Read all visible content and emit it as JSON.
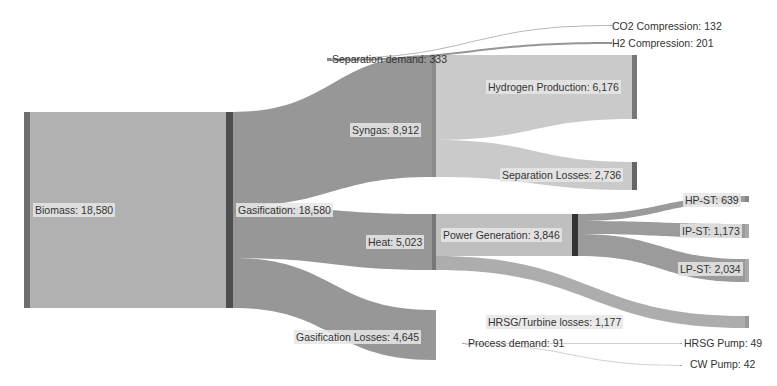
{
  "chart_data": {
    "type": "sankey",
    "title": "",
    "nodes": [
      {
        "id": "biomass",
        "label": "Biomass: 18,580",
        "name": "Biomass",
        "value": 18580,
        "x": 24,
        "y": 112,
        "w": 6,
        "h": 196,
        "color": "#6e6e6e"
      },
      {
        "id": "gasification",
        "label": "Gasification: 18,580",
        "name": "Gasification",
        "value": 18580,
        "x": 226,
        "y": 112,
        "w": 7,
        "h": 196,
        "color": "#4f4f4f"
      },
      {
        "id": "syngas",
        "label": "Syngas: 8,912",
        "name": "Syngas",
        "value": 8912,
        "x": 432,
        "y": 55,
        "w": 4,
        "h": 122,
        "color": "#8a8a8a"
      },
      {
        "id": "heat",
        "label": "Heat: 5,023",
        "name": "Heat",
        "value": 5023,
        "x": 432,
        "y": 214,
        "w": 4,
        "h": 56,
        "color": "#777777"
      },
      {
        "id": "gas_losses",
        "label": "Gasification Losses: 4,645",
        "name": "Gasification Losses",
        "value": 4645,
        "x": 432,
        "y": 310,
        "w": 4,
        "h": 50,
        "color": "#999999"
      },
      {
        "id": "sep_demand",
        "label": "Separation demand: 333",
        "name": "Separation demand",
        "value": 333,
        "x": 327,
        "y": 58,
        "w": 4,
        "h": 3,
        "color": "#888888"
      },
      {
        "id": "h2_prod",
        "label": "Hydrogen Production: 6,176",
        "name": "Hydrogen Production",
        "value": 6176,
        "x": 632,
        "y": 55,
        "w": 5,
        "h": 64,
        "color": "#777777"
      },
      {
        "id": "sep_losses",
        "label": "Separation Losses: 2,736",
        "name": "Separation Losses",
        "value": 2736,
        "x": 632,
        "y": 162,
        "w": 5,
        "h": 28,
        "color": "#666666"
      },
      {
        "id": "co2_comp",
        "label": "CO2 Compression: 132",
        "name": "CO2 Compression",
        "value": 132,
        "x": 610,
        "y": 25,
        "w": 2,
        "h": 1,
        "color": "#aaaaaa"
      },
      {
        "id": "h2_comp",
        "label": "H2 Compression: 201",
        "name": "H2 Compression",
        "value": 201,
        "x": 610,
        "y": 42,
        "w": 2,
        "h": 2,
        "color": "#888888"
      },
      {
        "id": "power_gen",
        "label": "Power Generation: 3,846",
        "name": "Power Generation",
        "value": 3846,
        "x": 572,
        "y": 214,
        "w": 6,
        "h": 42,
        "color": "#333333"
      },
      {
        "id": "hrsg_losses",
        "label": "HRSG/Turbine losses: 1,177",
        "name": "HRSG/Turbine losses",
        "value": 1177,
        "x": 745,
        "y": 316,
        "w": 4,
        "h": 12,
        "color": "#999999"
      },
      {
        "id": "hp_st",
        "label": "HP-ST: 639",
        "name": "HP-ST",
        "value": 639,
        "x": 745,
        "y": 196,
        "w": 4,
        "h": 6,
        "color": "#888888"
      },
      {
        "id": "ip_st",
        "label": "IP-ST: 1,173",
        "name": "IP-ST",
        "value": 1173,
        "x": 745,
        "y": 224,
        "w": 4,
        "h": 14,
        "color": "#aaaaaa"
      },
      {
        "id": "lp_st",
        "label": "LP-ST: 2,034",
        "name": "LP-ST",
        "value": 2034,
        "x": 745,
        "y": 259,
        "w": 4,
        "h": 23,
        "color": "#aaaaaa"
      },
      {
        "id": "proc_demand",
        "label": "Process demand: 91",
        "name": "Process demand",
        "value": 91,
        "x": 462,
        "y": 343,
        "w": 3,
        "h": 1,
        "color": "#aaaaaa"
      },
      {
        "id": "hrsg_pump",
        "label": "HRSG Pump: 49",
        "name": "HRSG Pump",
        "value": 49,
        "x": 680,
        "y": 343,
        "w": 2,
        "h": 1,
        "color": "#aaaaaa"
      },
      {
        "id": "cw_pump",
        "label": "CW Pump: 42",
        "name": "CW Pump",
        "value": 42,
        "x": 680,
        "y": 365,
        "w": 2,
        "h": 1,
        "color": "#aaaaaa"
      }
    ],
    "links": [
      {
        "source": "biomass",
        "target": "gasification",
        "value": 18580,
        "x0": 30,
        "y0a": 112,
        "y0b": 308,
        "x1": 226,
        "y1a": 112,
        "y1b": 308,
        "color": "#a8a8a8"
      },
      {
        "source": "gasification",
        "target": "syngas",
        "value": 8912,
        "x0": 233,
        "y0a": 112,
        "y0b": 206,
        "x1": 432,
        "y1a": 55,
        "y1b": 177,
        "color": "#8c8c8c"
      },
      {
        "source": "gasification",
        "target": "heat",
        "value": 5023,
        "x0": 233,
        "y0a": 206,
        "y0b": 258,
        "x1": 432,
        "y1a": 214,
        "y1b": 270,
        "color": "#8c8c8c"
      },
      {
        "source": "gasification",
        "target": "gas_losses",
        "value": 4645,
        "x0": 233,
        "y0a": 258,
        "y0b": 308,
        "x1": 432,
        "y1a": 310,
        "y1b": 360,
        "color": "#8c8c8c"
      },
      {
        "source": "syngas",
        "target": "h2_prod",
        "value": 6176,
        "x0": 436,
        "y0a": 55,
        "y0b": 140,
        "x1": 632,
        "y1a": 55,
        "y1b": 119,
        "color": "#c4c4c4"
      },
      {
        "source": "syngas",
        "target": "sep_losses",
        "value": 2736,
        "x0": 436,
        "y0a": 140,
        "y0b": 177,
        "x1": 632,
        "y1a": 162,
        "y1b": 190,
        "color": "#c4c4c4"
      },
      {
        "source": "sep_demand",
        "target": "co2_comp",
        "value": 132,
        "x0": 331,
        "y0a": 58,
        "y0b": 59,
        "x1": 610,
        "y1a": 25,
        "y1b": 26,
        "color": "#b0b0b0"
      },
      {
        "source": "sep_demand",
        "target": "h2_comp",
        "value": 201,
        "x0": 331,
        "y0a": 59,
        "y0b": 61,
        "x1": 610,
        "y1a": 42,
        "y1b": 44,
        "color": "#8a8a8a"
      },
      {
        "source": "heat",
        "target": "power_gen",
        "value": 3846,
        "x0": 436,
        "y0a": 214,
        "y0b": 256,
        "x1": 572,
        "y1a": 214,
        "y1b": 256,
        "color": "#b8b8b8"
      },
      {
        "source": "heat",
        "target": "hrsg_losses",
        "value": 1177,
        "x0": 436,
        "y0a": 256,
        "y0b": 270,
        "x1": 745,
        "y1a": 316,
        "y1b": 328,
        "color": "#a4a4a4"
      },
      {
        "source": "power_gen",
        "target": "hp_st",
        "value": 639,
        "x0": 578,
        "y0a": 214,
        "y0b": 221,
        "x1": 745,
        "y1a": 196,
        "y1b": 202,
        "color": "#909090"
      },
      {
        "source": "power_gen",
        "target": "ip_st",
        "value": 1173,
        "x0": 578,
        "y0a": 221,
        "y0b": 234,
        "x1": 745,
        "y1a": 224,
        "y1b": 238,
        "color": "#909090"
      },
      {
        "source": "power_gen",
        "target": "lp_st",
        "value": 2034,
        "x0": 578,
        "y0a": 234,
        "y0b": 256,
        "x1": 745,
        "y1a": 259,
        "y1b": 282,
        "color": "#909090"
      },
      {
        "source": "proc_demand",
        "target": "hrsg_pump",
        "value": 49,
        "x0": 465,
        "y0a": 343,
        "y0b": 344,
        "x1": 680,
        "y1a": 343,
        "y1b": 344,
        "color": "#cccccc"
      },
      {
        "source": "proc_demand",
        "target": "cw_pump",
        "value": 42,
        "x0": 465,
        "y0a": 344,
        "y0b": 345,
        "x1": 680,
        "y1a": 365,
        "y1b": 366,
        "color": "#cccccc"
      }
    ],
    "labels": [
      {
        "node": "biomass",
        "text": "Biomass: 18,580",
        "x": 33,
        "y": 203,
        "boxed": true
      },
      {
        "node": "gasification",
        "text": "Gasification: 18,580",
        "x": 236,
        "y": 203,
        "boxed": true
      },
      {
        "node": "syngas",
        "text": "Syngas: 8,912",
        "x": 350,
        "y": 123,
        "boxed": true
      },
      {
        "node": "heat",
        "text": "Heat: 5,023",
        "x": 366,
        "y": 235,
        "boxed": true
      },
      {
        "node": "gas_losses",
        "text": "Gasification Losses: 4,645",
        "x": 294,
        "y": 330,
        "boxed": true
      },
      {
        "node": "sep_demand",
        "text": "Separation demand: 333",
        "x": 330,
        "y": 52,
        "boxed": false
      },
      {
        "node": "co2_comp",
        "text": "CO2 Compression: 132",
        "x": 610,
        "y": 19,
        "boxed": false
      },
      {
        "node": "h2_comp",
        "text": "H2 Compression: 201",
        "x": 610,
        "y": 36,
        "boxed": false
      },
      {
        "node": "h2_prod",
        "text": "Hydrogen Production: 6,176",
        "x": 486,
        "y": 80,
        "boxed": true
      },
      {
        "node": "sep_losses",
        "text": "Separation Losses: 2,736",
        "x": 500,
        "y": 168,
        "boxed": true
      },
      {
        "node": "power_gen",
        "text": "Power Generation: 3,846",
        "x": 441,
        "y": 228,
        "boxed": true
      },
      {
        "node": "hrsg_losses",
        "text": "HRSG/Turbine losses: 1,177",
        "x": 486,
        "y": 315,
        "boxed": true
      },
      {
        "node": "hp_st",
        "text": "HP-ST: 639",
        "x": 683,
        "y": 193,
        "boxed": true
      },
      {
        "node": "ip_st",
        "text": "IP-ST: 1,173",
        "x": 680,
        "y": 224,
        "boxed": true
      },
      {
        "node": "lp_st",
        "text": "LP-ST: 2,034",
        "x": 678,
        "y": 262,
        "boxed": true
      },
      {
        "node": "proc_demand",
        "text": "Process demand: 91",
        "x": 466,
        "y": 336,
        "boxed": false
      },
      {
        "node": "hrsg_pump",
        "text": "HRSG Pump: 49",
        "x": 682,
        "y": 336,
        "boxed": false
      },
      {
        "node": "cw_pump",
        "text": "CW Pump: 42",
        "x": 688,
        "y": 357,
        "boxed": false
      }
    ]
  }
}
